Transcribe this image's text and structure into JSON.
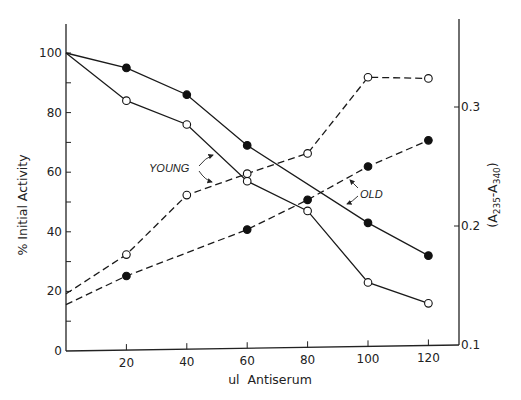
{
  "chart_data": {
    "type": "line",
    "title": "",
    "xlabel": "ul  Antiserum",
    "ylabel": "% Initial Activity",
    "y2label_base": "(A",
    "y2label_sub1": "235",
    "y2label_mid": "-A",
    "y2label_sub2": "340",
    "y2label_end": ")",
    "y2label": "(A235-A340)",
    "xlim": [
      0,
      130
    ],
    "ylim": [
      0,
      110
    ],
    "y2lim": [
      0.1,
      0.35
    ],
    "x_ticks": [
      20,
      40,
      60,
      80,
      100,
      120
    ],
    "y_ticks": [
      0,
      20,
      40,
      60,
      80,
      100
    ],
    "y2_ticks": [
      0.1,
      0.2,
      0.3
    ],
    "x_tick_labels": [
      "20",
      "40",
      "60",
      "80",
      "100",
      "120"
    ],
    "y_tick_labels": [
      "0",
      "20",
      "40",
      "60",
      "80",
      "100"
    ],
    "y2_tick_labels": [
      "0.1",
      "0.2",
      "0.3"
    ],
    "grid": false,
    "legend": "none",
    "annotations": [
      {
        "text": "YOUNG",
        "points_to": [
          "young_activity",
          "young_absorbance"
        ]
      },
      {
        "text": "OLD",
        "points_to": [
          "old_absorbance",
          "old_activity"
        ]
      }
    ],
    "series": [
      {
        "name": "Young - % Initial Activity",
        "id": "young_activity",
        "axis": "left",
        "style": "solid",
        "marker": "open-circle",
        "x": [
          0,
          20,
          40,
          60,
          80,
          100,
          120
        ],
        "values": [
          100,
          84,
          76,
          57,
          47,
          23,
          16
        ]
      },
      {
        "name": "Old - % Initial Activity",
        "id": "old_activity",
        "axis": "left",
        "style": "solid",
        "marker": "filled-circle",
        "x": [
          0,
          20,
          40,
          60,
          100,
          120
        ],
        "values": [
          100,
          95,
          86,
          69,
          43,
          32
        ]
      },
      {
        "name": "Young - (A235-A340)",
        "id": "young_absorbance",
        "axis": "right",
        "style": "dashed",
        "marker": "open-circle",
        "x": [
          0,
          20,
          40,
          60,
          80,
          100,
          120
        ],
        "values": [
          0.143,
          0.176,
          0.226,
          0.244,
          0.261,
          0.325,
          0.324
        ]
      },
      {
        "name": "Old - (A235-A340)",
        "id": "old_absorbance",
        "axis": "right",
        "style": "dashed",
        "marker": "filled-circle",
        "x": [
          0,
          20,
          60,
          80,
          100,
          120
        ],
        "values": [
          0.134,
          0.158,
          0.197,
          0.222,
          0.25,
          0.272
        ]
      }
    ]
  }
}
